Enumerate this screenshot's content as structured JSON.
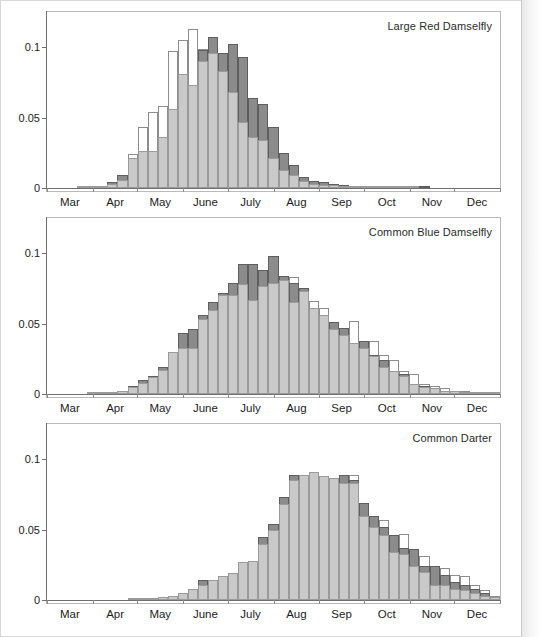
{
  "figure": {
    "y_ticks": [
      0,
      0.05,
      0.1
    ],
    "y_tick_labels": [
      "0",
      "0.05",
      "0.1"
    ],
    "month_labels": [
      "Mar",
      "Apr",
      "May",
      "June",
      "July",
      "Aug",
      "Sep",
      "Oct",
      "Nov",
      "Dec"
    ]
  },
  "chart_data": [
    {
      "type": "bar",
      "title": "Large Red Damselfly",
      "xlabel": "",
      "ylabel": "",
      "ylim": [
        0,
        0.125
      ],
      "xlim": [
        0,
        45
      ],
      "grid": false,
      "legend": "none",
      "categories": [
        "Mar",
        "Apr",
        "May",
        "June",
        "July",
        "Aug",
        "Sep",
        "Oct",
        "Nov",
        "Dec"
      ],
      "bin_label_note": "45 weekly bins spanning Mar 1 to Dec 31; month labels centred under each month",
      "series": [
        {
          "name": "white-outline",
          "fill": "#ffffff",
          "values": [
            0,
            0,
            0,
            0.0005,
            0.0005,
            0.001,
            0.002,
            0.009,
            0.024,
            0.043,
            0.054,
            0.058,
            0.097,
            0.105,
            0.113,
            0.099,
            0.095,
            0.095,
            0.102,
            0.092,
            0.063,
            0.06,
            0.043,
            0.025,
            0.016,
            0.008,
            0.005,
            0.004,
            0.003,
            0.002,
            0.0015,
            0.001,
            0.0008,
            0.0005,
            0.0003,
            0.0002,
            0.0001,
            0.0001,
            0,
            0,
            0,
            0,
            0,
            0,
            0
          ]
        },
        {
          "name": "dark-gray",
          "fill": "#8b8b8b",
          "values": [
            0,
            0,
            0,
            0.0005,
            0.0005,
            0.001,
            0.004,
            0.009,
            0.015,
            0.022,
            0.026,
            0.036,
            0.056,
            0.081,
            0.073,
            0.098,
            0.107,
            0.096,
            0.102,
            0.093,
            0.064,
            0.06,
            0.043,
            0.025,
            0.016,
            0.008,
            0.005,
            0.004,
            0.003,
            0.002,
            0.0015,
            0.001,
            0.0008,
            0.0005,
            0.0003,
            0.0002,
            0.0001,
            0.0001,
            0,
            0,
            0,
            0,
            0,
            0,
            0
          ]
        },
        {
          "name": "light-gray",
          "fill": "#c9c9c9",
          "values": [
            0,
            0,
            0,
            0.0005,
            0.0005,
            0.001,
            0.003,
            0.006,
            0.021,
            0.026,
            0.026,
            0.036,
            0.056,
            0.081,
            0.073,
            0.09,
            0.096,
            0.083,
            0.068,
            0.047,
            0.036,
            0.034,
            0.021,
            0.013,
            0.009,
            0.005,
            0.003,
            0.002,
            0.002,
            0.0015,
            0.001,
            0.0008,
            0.0005,
            0.0003,
            0.0002,
            0.0001,
            0.0001,
            0,
            0,
            0,
            0,
            0,
            0,
            0,
            0
          ]
        }
      ]
    },
    {
      "type": "bar",
      "title": "Common Blue Damselfly",
      "xlabel": "",
      "ylabel": "",
      "ylim": [
        0,
        0.125
      ],
      "xlim": [
        0,
        45
      ],
      "grid": false,
      "legend": "none",
      "categories": [
        "Mar",
        "Apr",
        "May",
        "June",
        "July",
        "Aug",
        "Sep",
        "Oct",
        "Nov",
        "Dec"
      ],
      "series": [
        {
          "name": "white-outline",
          "fill": "#ffffff",
          "values": [
            0,
            0,
            0,
            0,
            0.0003,
            0.0005,
            0.001,
            0.002,
            0.006,
            0.01,
            0.013,
            0.019,
            0.03,
            0.043,
            0.046,
            0.056,
            0.062,
            0.072,
            0.079,
            0.077,
            0.076,
            0.077,
            0.079,
            0.081,
            0.083,
            0.075,
            0.066,
            0.061,
            0.051,
            0.047,
            0.052,
            0.038,
            0.038,
            0.028,
            0.024,
            0.016,
            0.014,
            0.007,
            0.006,
            0.004,
            0.002,
            0.002,
            0.001,
            0.0005,
            0.0003
          ]
        },
        {
          "name": "dark-gray",
          "fill": "#8b8b8b",
          "values": [
            0,
            0,
            0,
            0,
            0.0003,
            0.0005,
            0.001,
            0.002,
            0.006,
            0.01,
            0.013,
            0.019,
            0.03,
            0.043,
            0.046,
            0.056,
            0.065,
            0.072,
            0.079,
            0.092,
            0.092,
            0.088,
            0.098,
            0.084,
            0.079,
            0.075,
            0.061,
            0.056,
            0.051,
            0.047,
            0.036,
            0.038,
            0.028,
            0.024,
            0.016,
            0.014,
            0.007,
            0.006,
            0.004,
            0.002,
            0.002,
            0.001,
            0.0005,
            0.0003,
            0.0002
          ]
        },
        {
          "name": "light-gray",
          "fill": "#c9c9c9",
          "values": [
            0,
            0,
            0,
            0,
            0.0003,
            0.0005,
            0.001,
            0.002,
            0.005,
            0.008,
            0.012,
            0.017,
            0.03,
            0.033,
            0.033,
            0.053,
            0.06,
            0.07,
            0.07,
            0.078,
            0.067,
            0.077,
            0.079,
            0.081,
            0.065,
            0.073,
            0.061,
            0.056,
            0.046,
            0.042,
            0.036,
            0.033,
            0.027,
            0.019,
            0.016,
            0.013,
            0.007,
            0.005,
            0.004,
            0.002,
            0.002,
            0.001,
            0.0005,
            0.0003,
            0.0002
          ]
        }
      ]
    },
    {
      "type": "bar",
      "title": "Common Darter",
      "xlabel": "",
      "ylabel": "",
      "ylim": [
        0,
        0.125
      ],
      "xlim": [
        0,
        45
      ],
      "grid": false,
      "legend": "none",
      "categories": [
        "Mar",
        "Apr",
        "May",
        "June",
        "July",
        "Aug",
        "Sep",
        "Oct",
        "Nov",
        "Dec"
      ],
      "series": [
        {
          "name": "white-outline",
          "fill": "#ffffff",
          "values": [
            0,
            0,
            0,
            0,
            0,
            0,
            0,
            0,
            0.0005,
            0.0008,
            0.001,
            0.002,
            0.003,
            0.005,
            0.008,
            0.011,
            0.014,
            0.017,
            0.019,
            0.027,
            0.028,
            0.04,
            0.05,
            0.068,
            0.085,
            0.089,
            0.091,
            0.088,
            0.087,
            0.089,
            0.089,
            0.069,
            0.06,
            0.057,
            0.046,
            0.047,
            0.036,
            0.031,
            0.024,
            0.023,
            0.018,
            0.017,
            0.011,
            0.007,
            0.003
          ]
        },
        {
          "name": "dark-gray",
          "fill": "#8b8b8b",
          "values": [
            0,
            0,
            0,
            0,
            0,
            0,
            0,
            0,
            0.0005,
            0.0008,
            0.001,
            0.002,
            0.003,
            0.005,
            0.008,
            0.014,
            0.014,
            0.017,
            0.019,
            0.027,
            0.028,
            0.045,
            0.054,
            0.073,
            0.089,
            0.089,
            0.091,
            0.088,
            0.087,
            0.089,
            0.085,
            0.069,
            0.06,
            0.052,
            0.046,
            0.037,
            0.036,
            0.024,
            0.024,
            0.018,
            0.013,
            0.011,
            0.008,
            0.005,
            0.002
          ]
        },
        {
          "name": "light-gray",
          "fill": "#c9c9c9",
          "values": [
            0,
            0,
            0,
            0,
            0,
            0,
            0,
            0,
            0.0005,
            0.0008,
            0.001,
            0.002,
            0.003,
            0.005,
            0.008,
            0.011,
            0.014,
            0.017,
            0.019,
            0.027,
            0.028,
            0.04,
            0.05,
            0.068,
            0.085,
            0.089,
            0.091,
            0.088,
            0.087,
            0.083,
            0.083,
            0.06,
            0.052,
            0.046,
            0.034,
            0.033,
            0.024,
            0.02,
            0.011,
            0.011,
            0.008,
            0.007,
            0.005,
            0.003,
            0.002
          ]
        }
      ]
    }
  ]
}
